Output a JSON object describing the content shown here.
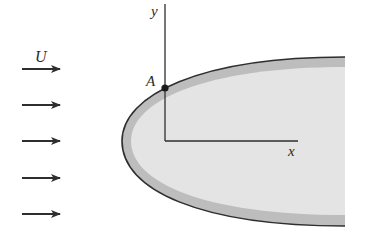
{
  "diagram": {
    "type": "flow-over-body",
    "labels": {
      "freestream": "U",
      "point": "A",
      "x_axis": "x",
      "y_axis": "y"
    },
    "arrows_count": 5,
    "colors": {
      "line": "#2e2e2e",
      "boundary_layer": "#bdbdbd",
      "body_fill": "#e4e4e4",
      "background": "#ffffff"
    }
  }
}
